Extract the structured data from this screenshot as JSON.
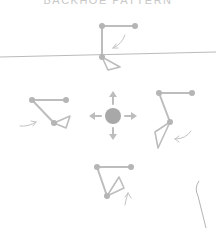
{
  "title": "BACKHOE PATTERN",
  "colors": {
    "stroke": "#bdbdbd",
    "node": "#b5b5b5",
    "joystick": "#a8a8a8",
    "arrow": "#c4c4c4",
    "divider": "#a0a0a0",
    "background": "#ffffff"
  },
  "joystick": {
    "center": [
      113,
      116
    ],
    "radius": 8,
    "directions": [
      "up",
      "down",
      "left",
      "right"
    ]
  },
  "poses": [
    {
      "name": "top",
      "direction": "up",
      "boom": [
        [
          102,
          26
        ],
        [
          135,
          26
        ]
      ],
      "stick": [
        [
          102,
          26
        ],
        [
          102,
          57
        ]
      ],
      "bucket": [
        [
          102,
          57
        ],
        [
          120,
          67
        ],
        [
          108,
          70
        ]
      ]
    },
    {
      "name": "left",
      "direction": "left",
      "boom": [
        [
          32,
          100
        ],
        [
          66,
          100
        ]
      ],
      "stick": [
        [
          32,
          100
        ],
        [
          54,
          123
        ]
      ],
      "bucket": [
        [
          54,
          123
        ],
        [
          70,
          116
        ],
        [
          66,
          128
        ]
      ]
    },
    {
      "name": "right",
      "direction": "right",
      "boom": [
        [
          159,
          93
        ],
        [
          192,
          93
        ]
      ],
      "stick": [
        [
          159,
          93
        ],
        [
          170,
          122
        ]
      ],
      "bucket": [
        [
          170,
          122
        ],
        [
          155,
          132
        ],
        [
          158,
          148
        ]
      ]
    },
    {
      "name": "bottom",
      "direction": "down",
      "boom": [
        [
          97,
          167
        ],
        [
          131,
          167
        ]
      ],
      "stick": [
        [
          97,
          167
        ],
        [
          107,
          196
        ]
      ],
      "bucket": [
        [
          107,
          196
        ],
        [
          119,
          177
        ],
        [
          124,
          188
        ]
      ]
    }
  ]
}
